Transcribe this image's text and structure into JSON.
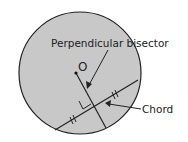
{
  "diagram": {
    "colors": {
      "circle_fill": "#c8c8c8",
      "stroke": "#222222",
      "background": "#ffffff"
    },
    "labels": {
      "center": "O",
      "perpendicular_bisector": "Perpendicular bisector",
      "chord": "Chord"
    },
    "elements": [
      {
        "type": "circle",
        "name": "circle"
      },
      {
        "type": "point",
        "name": "center-point",
        "label": "O"
      },
      {
        "type": "line",
        "name": "perpendicular-bisector-line"
      },
      {
        "type": "line",
        "name": "chord-line"
      },
      {
        "type": "marker",
        "name": "right-angle-marker"
      },
      {
        "type": "tick-marks",
        "name": "equal-segment-marks",
        "count": 2,
        "style": "double"
      },
      {
        "type": "arrow",
        "name": "bisector-arrow"
      },
      {
        "type": "arrow",
        "name": "chord-arrow"
      }
    ]
  }
}
